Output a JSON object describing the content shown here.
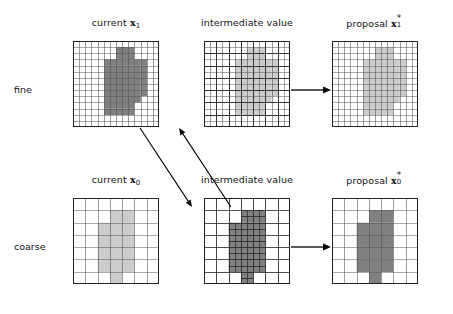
{
  "figure": {
    "row_labels": [
      {
        "id": "fine",
        "label": "fine"
      },
      {
        "id": "coarse",
        "label": "coarse"
      }
    ],
    "column_labels": [
      {
        "id": "current-fine",
        "text": "current",
        "symbol": "x",
        "subscript": "1",
        "superscript": ""
      },
      {
        "id": "intermediate-fine",
        "text": "intermediate value",
        "symbol": "",
        "subscript": "",
        "superscript": ""
      },
      {
        "id": "proposal-fine",
        "text": "proposal",
        "symbol": "x",
        "subscript": "1",
        "superscript": "*"
      },
      {
        "id": "current-coarse",
        "text": "current",
        "symbol": "x",
        "subscript": "0",
        "superscript": ""
      },
      {
        "id": "intermediate-coarse",
        "text": "intermediate value",
        "symbol": "",
        "subscript": "",
        "superscript": ""
      },
      {
        "id": "proposal-coarse",
        "text": "proposal",
        "symbol": "x",
        "subscript": "0",
        "superscript": "*"
      }
    ],
    "colors": {
      "dark_fill": "#808080",
      "light_fill": "#cccccc",
      "fine_line": "#555555",
      "coarse_line": "#333333",
      "border": "#222222",
      "arrow": "#000000",
      "background": "#ffffff"
    },
    "panels": [
      {
        "id": "fine-current",
        "row": "fine",
        "column": "current",
        "x": 73,
        "y": 41,
        "size": 86,
        "grid_n": 14,
        "coarse_n": 0,
        "fill": "#808080",
        "shape_cells": [
          [
            7,
            1
          ],
          [
            8,
            1
          ],
          [
            9,
            1
          ],
          [
            7,
            2
          ],
          [
            8,
            2
          ],
          [
            9,
            2
          ],
          [
            5,
            3
          ],
          [
            6,
            3
          ],
          [
            7,
            3
          ],
          [
            8,
            3
          ],
          [
            9,
            3
          ],
          [
            10,
            3
          ],
          [
            11,
            3
          ],
          [
            5,
            4
          ],
          [
            6,
            4
          ],
          [
            7,
            4
          ],
          [
            8,
            4
          ],
          [
            9,
            4
          ],
          [
            10,
            4
          ],
          [
            11,
            4
          ],
          [
            5,
            5
          ],
          [
            6,
            5
          ],
          [
            7,
            5
          ],
          [
            8,
            5
          ],
          [
            9,
            5
          ],
          [
            10,
            5
          ],
          [
            11,
            5
          ],
          [
            5,
            6
          ],
          [
            6,
            6
          ],
          [
            7,
            6
          ],
          [
            8,
            6
          ],
          [
            9,
            6
          ],
          [
            10,
            6
          ],
          [
            11,
            6
          ],
          [
            5,
            7
          ],
          [
            6,
            7
          ],
          [
            7,
            7
          ],
          [
            8,
            7
          ],
          [
            9,
            7
          ],
          [
            10,
            7
          ],
          [
            11,
            7
          ],
          [
            5,
            8
          ],
          [
            6,
            8
          ],
          [
            7,
            8
          ],
          [
            8,
            8
          ],
          [
            9,
            8
          ],
          [
            10,
            8
          ],
          [
            11,
            8
          ],
          [
            5,
            9
          ],
          [
            6,
            9
          ],
          [
            7,
            9
          ],
          [
            8,
            9
          ],
          [
            9,
            9
          ],
          [
            10,
            9
          ],
          [
            5,
            10
          ],
          [
            6,
            10
          ],
          [
            7,
            10
          ],
          [
            8,
            10
          ],
          [
            9,
            10
          ],
          [
            5,
            11
          ],
          [
            6,
            11
          ],
          [
            7,
            11
          ],
          [
            8,
            11
          ],
          [
            9,
            11
          ]
        ]
      },
      {
        "id": "fine-intermediate",
        "row": "fine",
        "column": "intermediate",
        "x": 204,
        "y": 41,
        "size": 86,
        "grid_n": 14,
        "coarse_n": 7,
        "fill": "#cccccc",
        "shape_cells": [
          [
            7,
            1
          ],
          [
            8,
            1
          ],
          [
            9,
            1
          ],
          [
            7,
            2
          ],
          [
            8,
            2
          ],
          [
            9,
            2
          ],
          [
            5,
            3
          ],
          [
            6,
            3
          ],
          [
            7,
            3
          ],
          [
            8,
            3
          ],
          [
            9,
            3
          ],
          [
            10,
            3
          ],
          [
            11,
            3
          ],
          [
            5,
            4
          ],
          [
            6,
            4
          ],
          [
            7,
            4
          ],
          [
            8,
            4
          ],
          [
            9,
            4
          ],
          [
            10,
            4
          ],
          [
            11,
            4
          ],
          [
            5,
            5
          ],
          [
            6,
            5
          ],
          [
            7,
            5
          ],
          [
            8,
            5
          ],
          [
            9,
            5
          ],
          [
            10,
            5
          ],
          [
            11,
            5
          ],
          [
            5,
            6
          ],
          [
            6,
            6
          ],
          [
            7,
            6
          ],
          [
            8,
            6
          ],
          [
            9,
            6
          ],
          [
            10,
            6
          ],
          [
            11,
            6
          ],
          [
            5,
            7
          ],
          [
            6,
            7
          ],
          [
            7,
            7
          ],
          [
            8,
            7
          ],
          [
            9,
            7
          ],
          [
            10,
            7
          ],
          [
            11,
            7
          ],
          [
            5,
            8
          ],
          [
            6,
            8
          ],
          [
            7,
            8
          ],
          [
            8,
            8
          ],
          [
            9,
            8
          ],
          [
            10,
            8
          ],
          [
            11,
            8
          ],
          [
            5,
            9
          ],
          [
            6,
            9
          ],
          [
            7,
            9
          ],
          [
            8,
            9
          ],
          [
            9,
            9
          ],
          [
            10,
            9
          ],
          [
            5,
            10
          ],
          [
            6,
            10
          ],
          [
            7,
            10
          ],
          [
            8,
            10
          ],
          [
            9,
            10
          ],
          [
            5,
            11
          ],
          [
            6,
            11
          ],
          [
            7,
            11
          ],
          [
            8,
            11
          ],
          [
            9,
            11
          ]
        ]
      },
      {
        "id": "fine-proposal",
        "row": "fine",
        "column": "proposal",
        "x": 332,
        "y": 41,
        "size": 86,
        "grid_n": 14,
        "coarse_n": 0,
        "fill": "#cccccc",
        "shape_cells": [
          [
            7,
            1
          ],
          [
            8,
            1
          ],
          [
            9,
            1
          ],
          [
            7,
            2
          ],
          [
            8,
            2
          ],
          [
            9,
            2
          ],
          [
            5,
            3
          ],
          [
            6,
            3
          ],
          [
            7,
            3
          ],
          [
            8,
            3
          ],
          [
            9,
            3
          ],
          [
            10,
            3
          ],
          [
            11,
            3
          ],
          [
            5,
            4
          ],
          [
            6,
            4
          ],
          [
            7,
            4
          ],
          [
            8,
            4
          ],
          [
            9,
            4
          ],
          [
            10,
            4
          ],
          [
            11,
            4
          ],
          [
            5,
            5
          ],
          [
            6,
            5
          ],
          [
            7,
            5
          ],
          [
            8,
            5
          ],
          [
            9,
            5
          ],
          [
            10,
            5
          ],
          [
            11,
            5
          ],
          [
            5,
            6
          ],
          [
            6,
            6
          ],
          [
            7,
            6
          ],
          [
            8,
            6
          ],
          [
            9,
            6
          ],
          [
            10,
            6
          ],
          [
            11,
            6
          ],
          [
            5,
            7
          ],
          [
            6,
            7
          ],
          [
            7,
            7
          ],
          [
            8,
            7
          ],
          [
            9,
            7
          ],
          [
            10,
            7
          ],
          [
            11,
            7
          ],
          [
            5,
            8
          ],
          [
            6,
            8
          ],
          [
            7,
            8
          ],
          [
            8,
            8
          ],
          [
            9,
            8
          ],
          [
            10,
            8
          ],
          [
            11,
            8
          ],
          [
            5,
            9
          ],
          [
            6,
            9
          ],
          [
            7,
            9
          ],
          [
            8,
            9
          ],
          [
            9,
            9
          ],
          [
            10,
            9
          ],
          [
            5,
            10
          ],
          [
            6,
            10
          ],
          [
            7,
            10
          ],
          [
            8,
            10
          ],
          [
            9,
            10
          ],
          [
            5,
            11
          ],
          [
            6,
            11
          ],
          [
            7,
            11
          ],
          [
            8,
            11
          ],
          [
            9,
            11
          ]
        ]
      },
      {
        "id": "coarse-current",
        "row": "coarse",
        "column": "current",
        "x": 73,
        "y": 198,
        "size": 86,
        "grid_n": 7,
        "coarse_n": 0,
        "fill": "#cccccc",
        "shape_cells": [
          [
            3,
            1
          ],
          [
            4,
            1
          ],
          [
            2,
            2
          ],
          [
            3,
            2
          ],
          [
            4,
            2
          ],
          [
            2,
            3
          ],
          [
            3,
            3
          ],
          [
            4,
            3
          ],
          [
            2,
            4
          ],
          [
            3,
            4
          ],
          [
            4,
            4
          ],
          [
            2,
            5
          ],
          [
            3,
            5
          ],
          [
            4,
            5
          ],
          [
            3,
            6
          ]
        ]
      },
      {
        "id": "coarse-intermediate",
        "row": "coarse",
        "column": "intermediate",
        "x": 204,
        "y": 198,
        "size": 86,
        "grid_n": 7,
        "coarse_n": 14,
        "fill": "#808080",
        "shape_cells": [
          [
            3,
            1
          ],
          [
            4,
            1
          ],
          [
            2,
            2
          ],
          [
            3,
            2
          ],
          [
            4,
            2
          ],
          [
            2,
            3
          ],
          [
            3,
            3
          ],
          [
            4,
            3
          ],
          [
            2,
            4
          ],
          [
            3,
            4
          ],
          [
            4,
            4
          ],
          [
            2,
            5
          ],
          [
            3,
            5
          ],
          [
            4,
            5
          ],
          [
            3,
            6
          ]
        ]
      },
      {
        "id": "coarse-proposal",
        "row": "coarse",
        "column": "proposal",
        "x": 332,
        "y": 198,
        "size": 86,
        "grid_n": 7,
        "coarse_n": 0,
        "fill": "#808080",
        "shape_cells": [
          [
            3,
            1
          ],
          [
            4,
            1
          ],
          [
            2,
            2
          ],
          [
            3,
            2
          ],
          [
            4,
            2
          ],
          [
            2,
            3
          ],
          [
            3,
            3
          ],
          [
            4,
            3
          ],
          [
            2,
            4
          ],
          [
            3,
            4
          ],
          [
            4,
            4
          ],
          [
            2,
            5
          ],
          [
            3,
            5
          ],
          [
            4,
            5
          ],
          [
            3,
            6
          ]
        ]
      }
    ],
    "arrows": [
      {
        "id": "fine-intermediate-to-proposal",
        "kind": "straight",
        "x1": 291,
        "y1": 90,
        "x2": 331,
        "y2": 90
      },
      {
        "id": "coarse-intermediate-to-proposal",
        "kind": "straight",
        "x1": 291,
        "y1": 247,
        "x2": 331,
        "y2": 247
      },
      {
        "id": "fine-current-to-coarse-current",
        "kind": "diagonal",
        "x1": 140,
        "y1": 128,
        "x2": 192,
        "y2": 207
      },
      {
        "id": "coarse-proposal-to-fine-intermediate",
        "kind": "diagonal",
        "x1": 231,
        "y1": 207,
        "x2": 179,
        "y2": 128
      }
    ],
    "label_positions": {
      "fine_row_label": {
        "x": 14,
        "y": 84
      },
      "coarse_row_label": {
        "x": 14,
        "y": 241
      },
      "fine_current": {
        "cx": 116,
        "y": 17
      },
      "fine_intermediate": {
        "cx": 247,
        "y": 17
      },
      "fine_proposal": {
        "cx": 375,
        "y": 17
      },
      "coarse_current": {
        "cx": 116,
        "y": 174
      },
      "coarse_intermediate": {
        "cx": 247,
        "y": 174
      },
      "coarse_proposal": {
        "cx": 375,
        "y": 174
      }
    }
  }
}
